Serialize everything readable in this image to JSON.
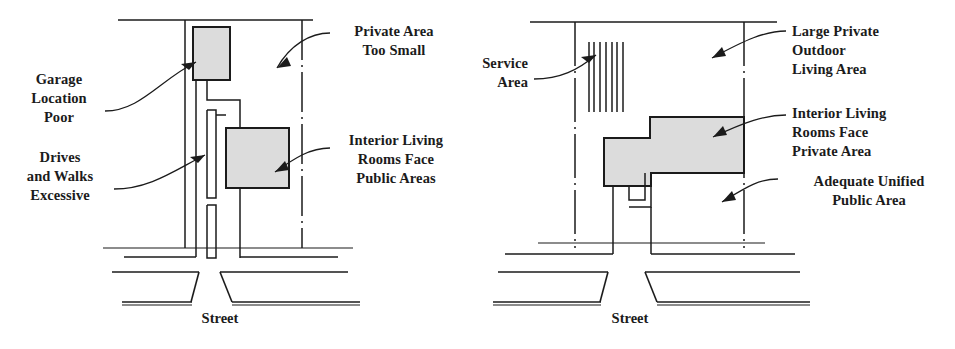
{
  "figure": {
    "kind": "site-plan-comparison",
    "colors": {
      "ink": "#1b1b1b",
      "building_fill": "#dcdcdc",
      "building_stroke": "#1b1b1b",
      "paper": "#ffffff"
    }
  },
  "left_plan": {
    "name": "poor-site-plan",
    "street_label": "Street",
    "annotations": [
      {
        "id": "garage-location-poor",
        "text": "Garage\nLocation\nPoor",
        "align": "center",
        "points_to": "garage-building"
      },
      {
        "id": "drives-and-walks-excessive",
        "text": "Drives\nand Walks\nExcessive",
        "align": "center",
        "points_to": "driveway"
      },
      {
        "id": "private-area-too-small",
        "text": "Private Area\nToo Small",
        "align": "center",
        "points_to": "rear-yard"
      },
      {
        "id": "interior-living-rooms-face-public-areas",
        "text": "Interior Living\nRooms Face\nPublic Areas",
        "align": "center",
        "points_to": "house-building"
      }
    ]
  },
  "right_plan": {
    "name": "good-site-plan",
    "street_label": "Street",
    "annotations": [
      {
        "id": "service-area",
        "text": "Service\nArea",
        "align": "right",
        "points_to": "service-hatch"
      },
      {
        "id": "large-private-outdoor-living-area",
        "text": "Large Private\nOutdoor\nLiving Area",
        "align": "left",
        "points_to": "rear-yard"
      },
      {
        "id": "interior-living-rooms-face-private-area",
        "text": "Interior Living\nRooms Face\nPrivate Area",
        "align": "left",
        "points_to": "house-building"
      },
      {
        "id": "adequate-unified-public-area",
        "text": "Adequate Unified\nPublic Area",
        "align": "center",
        "points_to": "front-yard"
      }
    ]
  }
}
